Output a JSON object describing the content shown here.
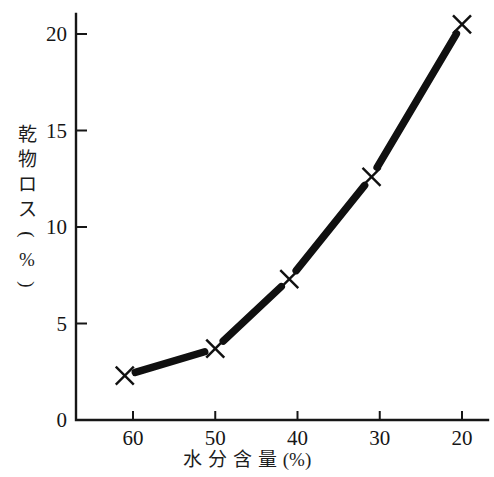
{
  "chart_data": {
    "type": "line",
    "title": "",
    "subtitle": "",
    "xlabel": "水分含量 (%)",
    "ylabel": "乾物ロス (%)",
    "xlabel_chars": [
      "水",
      "分",
      "含",
      "量",
      "(%)"
    ],
    "ylabel_chars": [
      "乾",
      "物",
      "ロ",
      "ス",
      "(",
      "%",
      ")"
    ],
    "x": [
      61,
      50,
      41,
      31,
      20
    ],
    "values": [
      2.3,
      3.7,
      7.3,
      12.6,
      20.5
    ],
    "series": [
      {
        "name": "乾物ロス",
        "points": [
          {
            "x": 61,
            "y": 2.3
          },
          {
            "x": 50,
            "y": 3.7
          },
          {
            "x": 41,
            "y": 7.3
          },
          {
            "x": 31,
            "y": 12.6
          },
          {
            "x": 20,
            "y": 20.5
          }
        ]
      }
    ],
    "xlim": [
      65,
      17
    ],
    "ylim": [
      0,
      21
    ],
    "x_reversed": true,
    "xticks": [
      60,
      50,
      40,
      30,
      20
    ],
    "yticks": [
      0,
      5,
      10,
      15,
      20
    ],
    "xtick_labels": [
      "60",
      "50",
      "40",
      "30",
      "20"
    ],
    "ytick_labels": [
      "0",
      "5",
      "10",
      "15",
      "20"
    ],
    "grid": false,
    "legend": null,
    "marker": "x",
    "line_color": "#101010",
    "background_color": "#ffffff",
    "axis_color": "#161616"
  }
}
